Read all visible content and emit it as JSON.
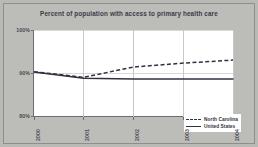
{
  "chart_data": {
    "type": "line",
    "title": "Percent of population with access to primary health care",
    "xlabel": "",
    "ylabel": "",
    "x": [
      "2000",
      "2001",
      "2002",
      "2003",
      "2004"
    ],
    "categories": [
      "2000",
      "2001",
      "2002",
      "2003",
      "2004"
    ],
    "ylim": [
      80,
      100
    ],
    "yticks": [
      "80%",
      "90%",
      "100%"
    ],
    "ytick_values": [
      80,
      90,
      100
    ],
    "grid": true,
    "legend_position": "inside-right-lower",
    "series": [
      {
        "name": "North Carolina",
        "style": "dashed",
        "color": "#2f3340",
        "values": [
          90.3,
          89.0,
          91.4,
          92.3,
          93.0
        ]
      },
      {
        "name": "United States",
        "style": "solid",
        "color": "#2f3340",
        "values": [
          90.2,
          88.8,
          88.6,
          88.6,
          88.6
        ]
      }
    ]
  },
  "chart": {
    "title": "Percent of population with access to primary health care",
    "y_axis": {
      "ticks": [
        "100%",
        "90%",
        "80%"
      ]
    },
    "x_axis": {
      "ticks": [
        "2000",
        "2001",
        "2002",
        "2003",
        "2004"
      ]
    },
    "legend": {
      "items": [
        {
          "label": "North Carolina",
          "style": "dashed"
        },
        {
          "label": "United States",
          "style": "solid"
        }
      ]
    },
    "colors": {
      "background": "#b9b9b6",
      "plot_background": "#ffffff",
      "line": "#2f3340",
      "axis": "#6e6e72",
      "grid": "#c8c8cc",
      "text": "#3b3b46"
    }
  }
}
